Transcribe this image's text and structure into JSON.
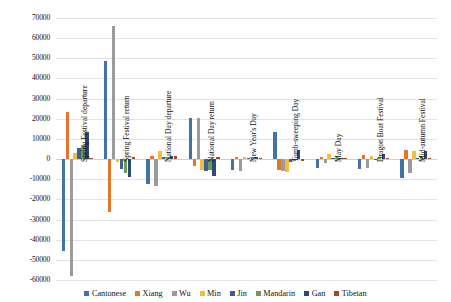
{
  "chart_data": {
    "type": "bar",
    "title": "",
    "xlabel": "",
    "ylabel": "",
    "ylim": [
      -60000,
      70000
    ],
    "ytick_step": 10000,
    "grid": true,
    "legend_position": "bottom",
    "yticks": [
      "70000",
      "60000",
      "50000",
      "40000",
      "30000",
      "20000",
      "10000",
      "0",
      "-10000",
      "-20000",
      "-30000",
      "-40000",
      "-50000",
      "-60000"
    ],
    "categories": [
      "Spring Festival departure",
      "Spring Festival return",
      "National Day departure",
      "National Day return",
      "New Year's Day",
      "Tomb-sweeping Day",
      "May Day",
      "Dragon Boat Festival",
      "Mid-autumn Festival"
    ],
    "series": [
      {
        "name": "Cantonese",
        "color": "#4472a8",
        "values": [
          -45800,
          48600,
          -12600,
          20400,
          -5200,
          13200,
          -4300,
          -5100,
          -9500
        ]
      },
      {
        "name": "Xiang",
        "color": "#e4762a",
        "values": [
          23300,
          -26300,
          1300,
          -3500,
          900,
          -5200,
          1100,
          1900,
          4300
        ]
      },
      {
        "name": "Wu",
        "color": "#9b9b9b",
        "values": [
          -57800,
          66000,
          -13300,
          20300,
          -6100,
          -5900,
          -2100,
          -4300,
          -7000
        ]
      },
      {
        "name": "Min",
        "color": "#f2bc3c",
        "values": [
          2900,
          -1300,
          4000,
          -5400,
          1200,
          -6400,
          2500,
          1400,
          3900
        ]
      },
      {
        "name": "Jin",
        "color": "#3f5f94",
        "values": [
          5400,
          -4700,
          800,
          -6000,
          600,
          -1400,
          500,
          -700,
          600
        ]
      },
      {
        "name": "Mandarin",
        "color": "#6f9b54",
        "values": [
          6900,
          -6800,
          400,
          -5200,
          300,
          -900,
          400,
          600,
          800
        ]
      },
      {
        "name": "Gan",
        "color": "#2d4a73",
        "values": [
          13600,
          -8700,
          1400,
          -8500,
          800,
          4400,
          600,
          2300,
          4200
        ]
      },
      {
        "name": "Tibetan",
        "color": "#a9441f",
        "values": [
          600,
          1100,
          1300,
          1200,
          500,
          -1100,
          400,
          500,
          700
        ]
      }
    ]
  },
  "legend": {
    "items": [
      {
        "label": "Cantonese"
      },
      {
        "label": "Xiang"
      },
      {
        "label": "Wu"
      },
      {
        "label": "Min"
      },
      {
        "label": "Jin"
      },
      {
        "label": "Mandarin"
      },
      {
        "label": "Gan"
      },
      {
        "label": "Tibetan"
      }
    ]
  }
}
